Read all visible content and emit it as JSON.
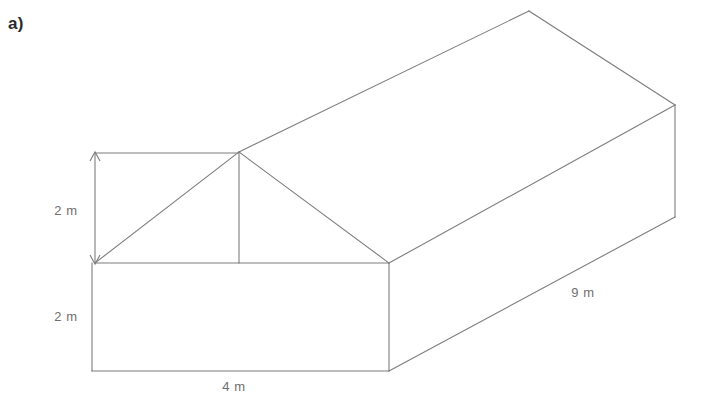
{
  "figure": {
    "part_label": "a)",
    "shape_name": "prism-with-gable-roof",
    "line_color": "#7d7d7d",
    "text_color": "#6e6e6e",
    "background_color": "#ffffff"
  },
  "dimensions": {
    "roof_height": {
      "value": "2 m",
      "x": 66,
      "y": 215
    },
    "wall_height": {
      "value": "2 m",
      "x": 66,
      "y": 321
    },
    "base_width": {
      "value": "4 m",
      "x": 234,
      "y": 391
    },
    "depth": {
      "value": "9 m",
      "x": 583,
      "y": 297
    }
  },
  "geometry": {
    "front_apex": {
      "x": 239,
      "y": 152
    },
    "front_eave_left": {
      "x": 95,
      "y": 263
    },
    "front_eave_right": {
      "x": 389,
      "y": 263
    },
    "front_base_left": {
      "x": 92,
      "y": 371
    },
    "front_base_right": {
      "x": 389,
      "y": 371
    },
    "rear_apex": {
      "x": 529,
      "y": 11
    },
    "rear_eave_right": {
      "x": 675,
      "y": 105
    },
    "rear_base_right": {
      "x": 675,
      "y": 217
    },
    "ridge_center_bottom": {
      "x": 239,
      "y": 263
    }
  },
  "paths": {
    "front_gable_left_slope": "M 95 263 L 239 152",
    "front_gable_right_slope": "M 239 152 L 389 263",
    "front_eave_line": "M 95 263 L 389 263",
    "gable_center_post": "M 239 152 L 239 263",
    "front_wall_left_edge": "M 92 263 L 92 371",
    "front_wall_right_edge": "M 389 263 L 389 371",
    "front_base_line": "M 92 371 L 389 371",
    "ridge_line": "M 239 152 L 529 11",
    "rear_gable_slope": "M 529 11 L 675 105",
    "roof_lower_right_edge": "M 389 263 L 675 105",
    "rear_vertical_edge": "M 675 105 L 675 217",
    "base_lower_right_edge": "M 389 371 L 675 217",
    "dim_top_reference_line": "M 95 153 L 239 153",
    "dim_vertical_arrow": "M 95 153 L 95 263",
    "dim_arrowhead_top": "M 90 161 L 95 152 L 100 161",
    "dim_arrowhead_bottom": "M 90 255 L 95 264 L 100 255"
  }
}
